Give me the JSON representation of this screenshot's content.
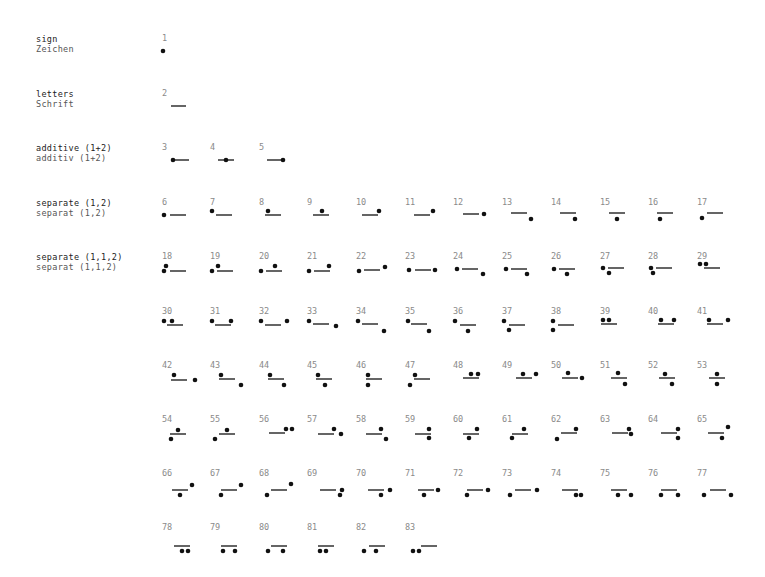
{
  "colors": {
    "ink": "#111111",
    "number": "#8a8a8a",
    "label_en": "#222222",
    "label_de": "#555555"
  },
  "groups": [
    {
      "en": "sign",
      "de": "Zeichen",
      "y": 34
    },
    {
      "en": "letters",
      "de": "Schrift",
      "y": 89
    },
    {
      "en": "additive (1+2)",
      "de": "additiv  (1+2)",
      "y": 143
    },
    {
      "en": "separate (1,2)",
      "de": "separat  (1,2)",
      "y": 198
    },
    {
      "en": "separate (1,1,2)",
      "de": "separat  (1,1,2)",
      "y": 252
    }
  ],
  "layout": {
    "col_x": [
      162,
      210,
      259,
      307,
      356,
      405,
      453,
      502,
      551,
      600,
      648,
      697
    ],
    "row_y": [
      33,
      88,
      142,
      197,
      251,
      306,
      360,
      414,
      468,
      522
    ]
  },
  "glyphs": [
    {
      "n": "1",
      "row": 0,
      "col": 0,
      "dots": [
        [
          1,
          18
        ]
      ],
      "line": null
    },
    {
      "n": "2",
      "row": 1,
      "col": 0,
      "dots": [],
      "line": [
        9,
        24,
        18
      ]
    },
    {
      "n": "3",
      "row": 2,
      "col": 0,
      "dots": [
        [
          11,
          18
        ]
      ],
      "line": [
        11,
        27,
        18
      ]
    },
    {
      "n": "4",
      "row": 2,
      "col": 1,
      "dots": [
        [
          16,
          18
        ]
      ],
      "line": [
        8,
        24,
        18
      ]
    },
    {
      "n": "5",
      "row": 2,
      "col": 2,
      "dots": [
        [
          24,
          18
        ]
      ],
      "line": [
        8,
        24,
        18
      ]
    },
    {
      "n": "6",
      "row": 3,
      "col": 0,
      "dots": [
        [
          2,
          18
        ]
      ],
      "line": [
        8,
        24,
        18
      ]
    },
    {
      "n": "7",
      "row": 3,
      "col": 1,
      "dots": [
        [
          2,
          14
        ]
      ],
      "line": [
        6,
        22,
        18
      ]
    },
    {
      "n": "8",
      "row": 3,
      "col": 2,
      "dots": [
        [
          9,
          14
        ]
      ],
      "line": [
        6,
        22,
        18
      ]
    },
    {
      "n": "9",
      "row": 3,
      "col": 3,
      "dots": [
        [
          15,
          14
        ]
      ],
      "line": [
        6,
        22,
        18
      ]
    },
    {
      "n": "10",
      "row": 3,
      "col": 4,
      "dots": [
        [
          23,
          14
        ]
      ],
      "line": [
        6,
        22,
        18
      ]
    },
    {
      "n": "11",
      "row": 3,
      "col": 5,
      "dots": [
        [
          28,
          14
        ]
      ],
      "line": [
        9,
        25,
        18
      ]
    },
    {
      "n": "12",
      "row": 3,
      "col": 6,
      "dots": [
        [
          31,
          17
        ]
      ],
      "line": [
        10,
        26,
        17
      ]
    },
    {
      "n": "13",
      "row": 3,
      "col": 7,
      "dots": [
        [
          29,
          22
        ]
      ],
      "line": [
        9,
        25,
        16
      ]
    },
    {
      "n": "14",
      "row": 3,
      "col": 8,
      "dots": [
        [
          24,
          22
        ]
      ],
      "line": [
        9,
        25,
        16
      ]
    },
    {
      "n": "15",
      "row": 3,
      "col": 9,
      "dots": [
        [
          17,
          22
        ]
      ],
      "line": [
        9,
        25,
        16
      ]
    },
    {
      "n": "16",
      "row": 3,
      "col": 10,
      "dots": [
        [
          12,
          22
        ]
      ],
      "line": [
        9,
        25,
        16
      ]
    },
    {
      "n": "17",
      "row": 3,
      "col": 11,
      "dots": [
        [
          5,
          21
        ]
      ],
      "line": [
        10,
        26,
        16
      ]
    },
    {
      "n": "18",
      "row": 4,
      "col": 0,
      "dots": [
        [
          4,
          15
        ],
        [
          2,
          20
        ]
      ],
      "line": [
        8,
        24,
        20
      ]
    },
    {
      "n": "19",
      "row": 4,
      "col": 1,
      "dots": [
        [
          2,
          20
        ],
        [
          8,
          15
        ]
      ],
      "line": [
        7,
        23,
        20
      ]
    },
    {
      "n": "20",
      "row": 4,
      "col": 2,
      "dots": [
        [
          2,
          20
        ],
        [
          16,
          15
        ]
      ],
      "line": [
        7,
        23,
        20
      ]
    },
    {
      "n": "21",
      "row": 4,
      "col": 3,
      "dots": [
        [
          2,
          20
        ],
        [
          22,
          15
        ]
      ],
      "line": [
        7,
        23,
        20
      ]
    },
    {
      "n": "22",
      "row": 4,
      "col": 4,
      "dots": [
        [
          3,
          20
        ],
        [
          29,
          16
        ]
      ],
      "line": [
        8,
        24,
        19
      ]
    },
    {
      "n": "23",
      "row": 4,
      "col": 5,
      "dots": [
        [
          4,
          19
        ],
        [
          30,
          19
        ]
      ],
      "line": [
        10,
        26,
        19
      ]
    },
    {
      "n": "24",
      "row": 4,
      "col": 6,
      "dots": [
        [
          4,
          18
        ],
        [
          30,
          23
        ]
      ],
      "line": [
        9,
        25,
        18
      ]
    },
    {
      "n": "25",
      "row": 4,
      "col": 7,
      "dots": [
        [
          4,
          18
        ],
        [
          25,
          23
        ]
      ],
      "line": [
        9,
        25,
        18
      ]
    },
    {
      "n": "26",
      "row": 4,
      "col": 8,
      "dots": [
        [
          3,
          18
        ],
        [
          16,
          23
        ]
      ],
      "line": [
        8,
        24,
        18
      ]
    },
    {
      "n": "27",
      "row": 4,
      "col": 9,
      "dots": [
        [
          3,
          17
        ],
        [
          9,
          22
        ]
      ],
      "line": [
        8,
        24,
        17
      ]
    },
    {
      "n": "28",
      "row": 4,
      "col": 10,
      "dots": [
        [
          3,
          17
        ],
        [
          5,
          22
        ]
      ],
      "line": [
        8,
        24,
        17
      ]
    },
    {
      "n": "29",
      "row": 4,
      "col": 11,
      "dots": [
        [
          3,
          13
        ],
        [
          9,
          13
        ]
      ],
      "line": [
        7,
        23,
        17
      ]
    },
    {
      "n": "30",
      "row": 5,
      "col": 0,
      "dots": [
        [
          2,
          15
        ],
        [
          10,
          15
        ]
      ],
      "line": [
        5,
        21,
        19
      ]
    },
    {
      "n": "31",
      "row": 5,
      "col": 1,
      "dots": [
        [
          2,
          15
        ],
        [
          21,
          15
        ]
      ],
      "line": [
        5,
        21,
        19
      ]
    },
    {
      "n": "32",
      "row": 5,
      "col": 2,
      "dots": [
        [
          2,
          15
        ],
        [
          28,
          15
        ]
      ],
      "line": [
        6,
        22,
        19
      ]
    },
    {
      "n": "33",
      "row": 5,
      "col": 3,
      "dots": [
        [
          2,
          15
        ],
        [
          29,
          20
        ]
      ],
      "line": [
        6,
        22,
        18
      ]
    },
    {
      "n": "34",
      "row": 5,
      "col": 4,
      "dots": [
        [
          2,
          15
        ],
        [
          28,
          25
        ]
      ],
      "line": [
        6,
        22,
        18
      ]
    },
    {
      "n": "35",
      "row": 5,
      "col": 5,
      "dots": [
        [
          3,
          15
        ],
        [
          24,
          25
        ]
      ],
      "line": [
        6,
        22,
        18
      ]
    },
    {
      "n": "36",
      "row": 5,
      "col": 6,
      "dots": [
        [
          2,
          15
        ],
        [
          15,
          25
        ]
      ],
      "line": [
        7,
        23,
        19
      ]
    },
    {
      "n": "37",
      "row": 5,
      "col": 7,
      "dots": [
        [
          2,
          15
        ],
        [
          7,
          24
        ]
      ],
      "line": [
        7,
        23,
        19
      ]
    },
    {
      "n": "38",
      "row": 5,
      "col": 8,
      "dots": [
        [
          2,
          15
        ],
        [
          2,
          24
        ]
      ],
      "line": [
        7,
        23,
        19
      ]
    },
    {
      "n": "39",
      "row": 5,
      "col": 9,
      "dots": [
        [
          3,
          14
        ],
        [
          9,
          14
        ]
      ],
      "line": [
        1,
        17,
        18
      ]
    },
    {
      "n": "40",
      "row": 5,
      "col": 10,
      "dots": [
        [
          13,
          14
        ],
        [
          26,
          14
        ]
      ],
      "line": [
        10,
        26,
        18
      ]
    },
    {
      "n": "41",
      "row": 5,
      "col": 11,
      "dots": [
        [
          12,
          14
        ],
        [
          31,
          14
        ]
      ],
      "line": [
        10,
        26,
        18
      ]
    },
    {
      "n": "42",
      "row": 6,
      "col": 0,
      "dots": [
        [
          12,
          15
        ],
        [
          33,
          20
        ]
      ],
      "line": [
        9,
        25,
        20
      ]
    },
    {
      "n": "43",
      "row": 6,
      "col": 1,
      "dots": [
        [
          11,
          15
        ],
        [
          31,
          25
        ]
      ],
      "line": [
        9,
        25,
        19
      ]
    },
    {
      "n": "44",
      "row": 6,
      "col": 2,
      "dots": [
        [
          11,
          15
        ],
        [
          25,
          25
        ]
      ],
      "line": [
        9,
        25,
        19
      ]
    },
    {
      "n": "45",
      "row": 6,
      "col": 3,
      "dots": [
        [
          11,
          15
        ],
        [
          18,
          25
        ]
      ],
      "line": [
        9,
        25,
        19
      ]
    },
    {
      "n": "46",
      "row": 6,
      "col": 4,
      "dots": [
        [
          12,
          15
        ],
        [
          12,
          25
        ]
      ],
      "line": [
        10,
        26,
        19
      ]
    },
    {
      "n": "47",
      "row": 6,
      "col": 5,
      "dots": [
        [
          10,
          15
        ],
        [
          5,
          25
        ]
      ],
      "line": [
        9,
        25,
        19
      ]
    },
    {
      "n": "48",
      "row": 6,
      "col": 6,
      "dots": [
        [
          18,
          14
        ],
        [
          25,
          14
        ]
      ],
      "line": [
        10,
        26,
        18
      ]
    },
    {
      "n": "49",
      "row": 6,
      "col": 7,
      "dots": [
        [
          21,
          14
        ],
        [
          34,
          14
        ]
      ],
      "line": [
        14,
        30,
        18
      ]
    },
    {
      "n": "50",
      "row": 6,
      "col": 8,
      "dots": [
        [
          17,
          13
        ],
        [
          31,
          18
        ]
      ],
      "line": [
        11,
        27,
        18
      ]
    },
    {
      "n": "51",
      "row": 6,
      "col": 9,
      "dots": [
        [
          18,
          13
        ],
        [
          25,
          24
        ]
      ],
      "line": [
        11,
        27,
        18
      ]
    },
    {
      "n": "52",
      "row": 6,
      "col": 10,
      "dots": [
        [
          17,
          14
        ],
        [
          24,
          24
        ]
      ],
      "line": [
        11,
        27,
        18
      ]
    },
    {
      "n": "53",
      "row": 6,
      "col": 11,
      "dots": [
        [
          20,
          14
        ],
        [
          20,
          24
        ]
      ],
      "line": [
        12,
        28,
        18
      ]
    },
    {
      "n": "54",
      "row": 7,
      "col": 0,
      "dots": [
        [
          16,
          16
        ],
        [
          9,
          25
        ]
      ],
      "line": [
        8,
        24,
        20
      ]
    },
    {
      "n": "55",
      "row": 7,
      "col": 1,
      "dots": [
        [
          17,
          16
        ],
        [
          5,
          25
        ]
      ],
      "line": [
        9,
        25,
        20
      ]
    },
    {
      "n": "56",
      "row": 7,
      "col": 2,
      "dots": [
        [
          27,
          15
        ],
        [
          33,
          15
        ]
      ],
      "line": [
        10,
        26,
        19
      ]
    },
    {
      "n": "57",
      "row": 7,
      "col": 3,
      "dots": [
        [
          27,
          15
        ],
        [
          34,
          20
        ]
      ],
      "line": [
        11,
        27,
        20
      ]
    },
    {
      "n": "58",
      "row": 7,
      "col": 4,
      "dots": [
        [
          25,
          15
        ],
        [
          30,
          25
        ]
      ],
      "line": [
        10,
        26,
        20
      ]
    },
    {
      "n": "59",
      "row": 7,
      "col": 5,
      "dots": [
        [
          24,
          15
        ],
        [
          24,
          24
        ]
      ],
      "line": [
        10,
        26,
        20
      ]
    },
    {
      "n": "60",
      "row": 7,
      "col": 6,
      "dots": [
        [
          24,
          15
        ],
        [
          16,
          24
        ]
      ],
      "line": [
        10,
        26,
        20
      ]
    },
    {
      "n": "61",
      "row": 7,
      "col": 7,
      "dots": [
        [
          22,
          15
        ],
        [
          10,
          24
        ]
      ],
      "line": [
        10,
        26,
        20
      ]
    },
    {
      "n": "62",
      "row": 7,
      "col": 8,
      "dots": [
        [
          6,
          25
        ],
        [
          25,
          15
        ]
      ],
      "line": [
        10,
        26,
        19
      ]
    },
    {
      "n": "63",
      "row": 7,
      "col": 9,
      "dots": [
        [
          29,
          15
        ],
        [
          31,
          20
        ]
      ],
      "line": [
        12,
        28,
        19
      ]
    },
    {
      "n": "64",
      "row": 7,
      "col": 10,
      "dots": [
        [
          30,
          15
        ],
        [
          30,
          24
        ]
      ],
      "line": [
        13,
        29,
        19
      ]
    },
    {
      "n": "65",
      "row": 7,
      "col": 11,
      "dots": [
        [
          31,
          13
        ],
        [
          25,
          24
        ]
      ],
      "line": [
        11,
        27,
        19
      ]
    },
    {
      "n": "66",
      "row": 8,
      "col": 0,
      "dots": [
        [
          30,
          17
        ],
        [
          18,
          27
        ]
      ],
      "line": [
        10,
        26,
        22
      ]
    },
    {
      "n": "67",
      "row": 8,
      "col": 1,
      "dots": [
        [
          31,
          17
        ],
        [
          11,
          27
        ]
      ],
      "line": [
        11,
        27,
        22
      ]
    },
    {
      "n": "68",
      "row": 8,
      "col": 2,
      "dots": [
        [
          32,
          16
        ],
        [
          8,
          27
        ]
      ],
      "line": [
        12,
        28,
        22
      ]
    },
    {
      "n": "69",
      "row": 8,
      "col": 3,
      "dots": [
        [
          35,
          22
        ],
        [
          33,
          27
        ]
      ],
      "line": [
        13,
        29,
        22
      ]
    },
    {
      "n": "70",
      "row": 8,
      "col": 4,
      "dots": [
        [
          34,
          22
        ],
        [
          25,
          27
        ]
      ],
      "line": [
        12,
        28,
        22
      ]
    },
    {
      "n": "71",
      "row": 8,
      "col": 5,
      "dots": [
        [
          33,
          22
        ],
        [
          19,
          27
        ]
      ],
      "line": [
        13,
        29,
        22
      ]
    },
    {
      "n": "72",
      "row": 8,
      "col": 6,
      "dots": [
        [
          35,
          22
        ],
        [
          14,
          27
        ]
      ],
      "line": [
        14,
        30,
        22
      ]
    },
    {
      "n": "73",
      "row": 8,
      "col": 7,
      "dots": [
        [
          8,
          27
        ],
        [
          35,
          22
        ]
      ],
      "line": [
        13,
        29,
        22
      ]
    },
    {
      "n": "74",
      "row": 8,
      "col": 8,
      "dots": [
        [
          25,
          27
        ],
        [
          30,
          27
        ]
      ],
      "line": [
        11,
        27,
        22
      ]
    },
    {
      "n": "75",
      "row": 8,
      "col": 9,
      "dots": [
        [
          18,
          27
        ],
        [
          31,
          27
        ]
      ],
      "line": [
        11,
        27,
        22
      ]
    },
    {
      "n": "76",
      "row": 8,
      "col": 10,
      "dots": [
        [
          13,
          27
        ],
        [
          30,
          27
        ]
      ],
      "line": [
        13,
        29,
        22
      ]
    },
    {
      "n": "77",
      "row": 8,
      "col": 11,
      "dots": [
        [
          7,
          27
        ],
        [
          34,
          27
        ]
      ],
      "line": [
        13,
        29,
        22
      ]
    },
    {
      "n": "78",
      "row": 9,
      "col": 0,
      "dots": [
        [
          20,
          29
        ],
        [
          26,
          29
        ]
      ],
      "line": [
        12,
        28,
        24
      ]
    },
    {
      "n": "79",
      "row": 9,
      "col": 1,
      "dots": [
        [
          13,
          29
        ],
        [
          25,
          29
        ]
      ],
      "line": [
        11,
        27,
        24
      ]
    },
    {
      "n": "80",
      "row": 9,
      "col": 2,
      "dots": [
        [
          9,
          29
        ],
        [
          24,
          29
        ]
      ],
      "line": [
        12,
        28,
        24
      ]
    },
    {
      "n": "81",
      "row": 9,
      "col": 3,
      "dots": [
        [
          13,
          29
        ],
        [
          19,
          29
        ]
      ],
      "line": [
        11,
        27,
        24
      ]
    },
    {
      "n": "82",
      "row": 9,
      "col": 4,
      "dots": [
        [
          8,
          29
        ],
        [
          20,
          29
        ]
      ],
      "line": [
        13,
        29,
        24
      ]
    },
    {
      "n": "83",
      "row": 9,
      "col": 5,
      "dots": [
        [
          8,
          29
        ],
        [
          14,
          29
        ]
      ],
      "line": [
        16,
        32,
        24
      ]
    }
  ]
}
